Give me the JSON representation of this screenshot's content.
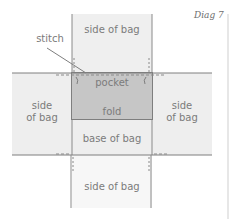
{
  "caption": "Diag 7",
  "labels": {
    "top_side": "side of bag",
    "stitch": "stitch",
    "pocket": "pocket",
    "left_side_line1": "side",
    "left_side_line2": "of bag",
    "fold": "fold",
    "right_side_line1": "side",
    "right_side_line2": "of bag",
    "base": "base of bag",
    "bottom_side": "side of bag"
  },
  "colors": {
    "panel_fill": "#eeeeee",
    "pocket_fill": "#c6c6c6",
    "outline": "#7e7e7e",
    "text": "#7b7b7b"
  }
}
